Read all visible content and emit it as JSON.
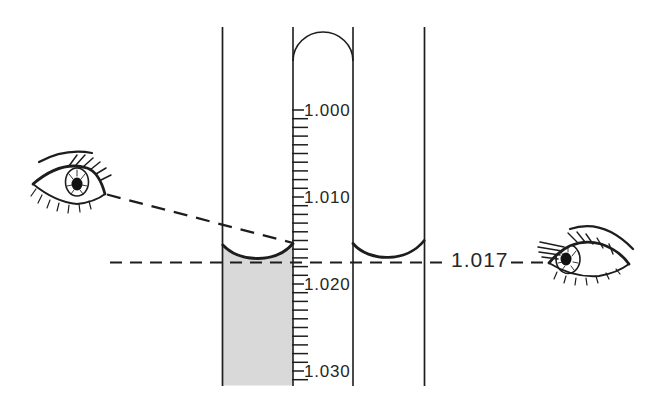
{
  "colors": {
    "background": "#ffffff",
    "line": "#1d1d1d",
    "text": "#262626",
    "fluid_shading": "#d9d9d9"
  },
  "scale": {
    "min": 1.0,
    "max": 1.03,
    "minor_step": 0.001,
    "major_step": 0.01,
    "labels": [
      "1.000",
      "1.010",
      "1.020",
      "1.030"
    ]
  },
  "reading": {
    "value": "1.017"
  },
  "icons": {
    "left_eye": "eye-looking-down-icon",
    "right_eye": "eye-at-meniscus-level-icon"
  }
}
